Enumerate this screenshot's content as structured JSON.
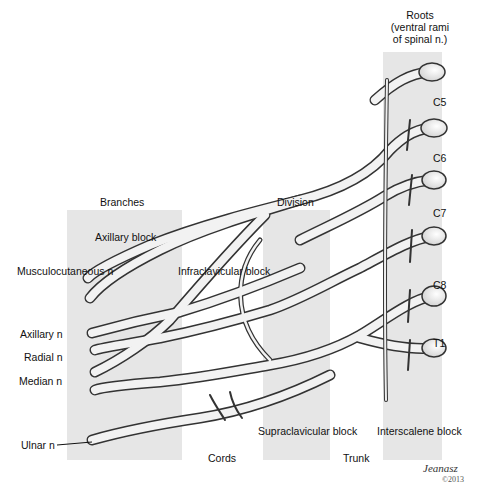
{
  "diagram": {
    "column_headers": {
      "branches": "Branches",
      "division": "Division",
      "roots": "Roots\n(ventral rami\nof spinal n.)",
      "roots_lines": [
        "Roots",
        "(ventral rami",
        "of spinal n.)"
      ],
      "cords": "Cords",
      "trunk": "Trunk"
    },
    "roots": [
      "C5",
      "C6",
      "C7",
      "C8",
      "T1"
    ],
    "nerves": {
      "musculocutaneous": "Musculocutaneous n",
      "axillary": "Axillary n",
      "radial": "Radial n",
      "median": "Median n",
      "ulnar": "Ulnar n"
    },
    "blocks": {
      "axillary": "Axillary block",
      "infraclavicular": "Infraclavicular block",
      "supraclavicular": "Supraclavicular block",
      "interscalene": "Interscalene block"
    },
    "signature": {
      "name": "Jeanasz",
      "copyright": "©2013"
    },
    "colors": {
      "panel": "#e6e6e6",
      "nerve_fill": "#f2f2f2",
      "nerve_outline": "#333333",
      "text": "#111111"
    }
  }
}
